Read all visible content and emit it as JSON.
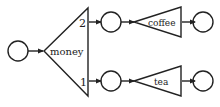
{
  "diagram": {
    "type": "string-diagram",
    "colors": {
      "stroke": "#222222",
      "background": "#ffffff"
    },
    "nodes": {
      "input": {
        "kind": "circle",
        "label": ""
      },
      "money": {
        "kind": "triangle",
        "label": "money",
        "outputs": [
          "2",
          "1"
        ]
      },
      "coffee": {
        "kind": "triangle",
        "label": "coffee"
      },
      "tea": {
        "kind": "triangle",
        "label": "tea"
      },
      "mid_top": {
        "kind": "circle",
        "label": ""
      },
      "mid_bottom": {
        "kind": "circle",
        "label": ""
      },
      "out_top": {
        "kind": "circle",
        "label": ""
      },
      "out_bottom": {
        "kind": "circle",
        "label": ""
      }
    },
    "port_labels": {
      "top": "2",
      "bottom": "1"
    },
    "edges": [
      [
        "input",
        "money"
      ],
      [
        "money.2",
        "mid_top"
      ],
      [
        "money.1",
        "mid_bottom"
      ],
      [
        "mid_top",
        "coffee"
      ],
      [
        "mid_bottom",
        "tea"
      ],
      [
        "coffee",
        "out_top"
      ],
      [
        "tea",
        "out_bottom"
      ]
    ]
  }
}
